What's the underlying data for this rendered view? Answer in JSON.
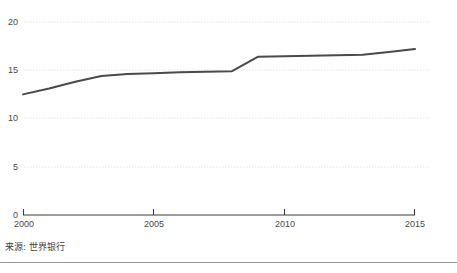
{
  "chart_data": {
    "type": "line",
    "title": "",
    "subtitle": "",
    "xlabel": "",
    "ylabel": "",
    "xlim": [
      2000,
      2015
    ],
    "ylim": [
      0,
      20
    ],
    "grid": true,
    "legend": null,
    "x_ticks": [
      "2000",
      "2005",
      "2010",
      "2015"
    ],
    "x_tick_values": [
      2000,
      2005,
      2010,
      2015
    ],
    "y_ticks": [
      "0",
      "5",
      "10",
      "15",
      "20"
    ],
    "y_tick_values": [
      0,
      5,
      10,
      15,
      20
    ],
    "line_color": "#4a4a4a",
    "line_width": 2,
    "x": [
      2000,
      2001,
      2002,
      2003,
      2004,
      2005,
      2006,
      2007,
      2008,
      2009,
      2010,
      2011,
      2012,
      2013,
      2014,
      2015
    ],
    "values": [
      12.5,
      13.1,
      13.8,
      14.4,
      14.6,
      14.7,
      14.8,
      14.85,
      14.9,
      16.4,
      16.45,
      16.5,
      16.55,
      16.6,
      16.9,
      17.2
    ],
    "series": [
      {
        "name": "",
        "values": [
          12.5,
          13.1,
          13.8,
          14.4,
          14.6,
          14.7,
          14.8,
          14.85,
          14.9,
          16.4,
          16.45,
          16.5,
          16.55,
          16.6,
          16.9,
          17.2
        ]
      }
    ],
    "source": "来源: 世界银行"
  },
  "axis": {
    "y_tick_0": "0",
    "y_tick_1": "5",
    "y_tick_2": "10",
    "y_tick_3": "15",
    "y_tick_4": "20",
    "x_tick_0": "2000",
    "x_tick_1": "2005",
    "x_tick_2": "2010",
    "x_tick_3": "2015"
  },
  "footer": {
    "source_text": "来源: 世界银行"
  },
  "colors": {
    "line": "#4a4a4a",
    "grid": "#e3e3e3",
    "axis": "#3d3d3d",
    "divider": "#9a9a9a",
    "background": "#ffffff"
  }
}
